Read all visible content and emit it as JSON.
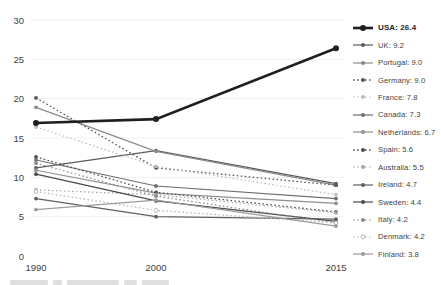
{
  "chart_data": {
    "type": "line",
    "title": "",
    "xlabel": "",
    "ylabel": "",
    "x": [
      1990,
      2000,
      2015
    ],
    "x_tick_labels": [
      "1990",
      "2000",
      "2015"
    ],
    "y_ticks": [
      0,
      5,
      10,
      15,
      20,
      25,
      30
    ],
    "ylim": [
      0,
      30
    ],
    "grid": "faint-horizontal",
    "legend_position": "right",
    "series": [
      {
        "name": "USA",
        "label": "USA: 26.4",
        "values": [
          16.9,
          17.4,
          26.4
        ],
        "color": "#1f1f1f",
        "dash": "solid",
        "width": 2.6,
        "marker": "filled",
        "bold": true
      },
      {
        "name": "UK",
        "label": "UK: 9.2",
        "values": [
          11.2,
          13.4,
          9.2
        ],
        "color": "#5a5a5a",
        "dash": "solid",
        "width": 1.2,
        "marker": "filled",
        "bold": false
      },
      {
        "name": "Portugal",
        "label": "Portugal: 9.0",
        "values": [
          18.9,
          13.3,
          9.0
        ],
        "color": "#8a8a8a",
        "dash": "solid",
        "width": 1.2,
        "marker": "filled",
        "bold": false
      },
      {
        "name": "Germany",
        "label": "Germany: 9.0",
        "values": [
          20.1,
          11.2,
          9.0
        ],
        "color": "#585858",
        "dash": "dotted",
        "width": 1.3,
        "marker": "filled",
        "bold": false
      },
      {
        "name": "France",
        "label": "France: 7.8",
        "values": [
          16.4,
          11.4,
          7.8
        ],
        "color": "#bdbdbd",
        "dash": "dotted",
        "width": 1.2,
        "marker": "filled",
        "bold": false
      },
      {
        "name": "Canada",
        "label": "Canada: 7.3",
        "values": [
          12.2,
          8.9,
          7.3
        ],
        "color": "#6e6e6e",
        "dash": "solid",
        "width": 1.2,
        "marker": "filled",
        "bold": false
      },
      {
        "name": "Netherlands",
        "label": "Netherlands: 6.7",
        "values": [
          10.9,
          8.0,
          6.7
        ],
        "color": "#8f8f8f",
        "dash": "solid",
        "width": 1.2,
        "marker": "filled",
        "bold": false
      },
      {
        "name": "Spain",
        "label": "Spain: 5.6",
        "values": [
          12.6,
          8.1,
          5.6
        ],
        "color": "#4f4f4f",
        "dash": "dotted",
        "width": 1.3,
        "marker": "filled",
        "bold": false
      },
      {
        "name": "Australia",
        "label": "Australia: 5.5",
        "values": [
          8.4,
          7.8,
          5.5
        ],
        "color": "#a8a8a8",
        "dash": "dotted",
        "width": 1.2,
        "marker": "filled",
        "bold": false
      },
      {
        "name": "Ireland",
        "label": "Ireland: 4.7",
        "values": [
          7.3,
          5.0,
          4.7
        ],
        "color": "#606060",
        "dash": "solid",
        "width": 1.2,
        "marker": "filled",
        "bold": false
      },
      {
        "name": "Sweden",
        "label": "Sweden: 4.4",
        "values": [
          10.4,
          7.0,
          4.4
        ],
        "color": "#4a4a4a",
        "dash": "solid",
        "width": 1.2,
        "marker": "filled",
        "bold": false
      },
      {
        "name": "Italy",
        "label": "Italy: 4.2",
        "values": [
          11.8,
          7.6,
          4.2
        ],
        "color": "#8d8d8d",
        "dash": "dotted",
        "width": 1.2,
        "marker": "filled",
        "bold": false
      },
      {
        "name": "Denmark",
        "label": "Denmark: 4.2",
        "values": [
          8.2,
          5.8,
          4.2
        ],
        "color": "#b8b8b8",
        "dash": "dotted",
        "width": 1.2,
        "marker": "open",
        "bold": false
      },
      {
        "name": "Finland",
        "label": "Finland: 3.8",
        "values": [
          5.9,
          7.1,
          3.8
        ],
        "color": "#9b9b9b",
        "dash": "solid",
        "width": 1.2,
        "marker": "filled",
        "bold": false
      }
    ],
    "colors": {
      "tick_text": "#3f3f3f",
      "gridline": "#f0f0f0",
      "background": "#ffffff"
    }
  }
}
